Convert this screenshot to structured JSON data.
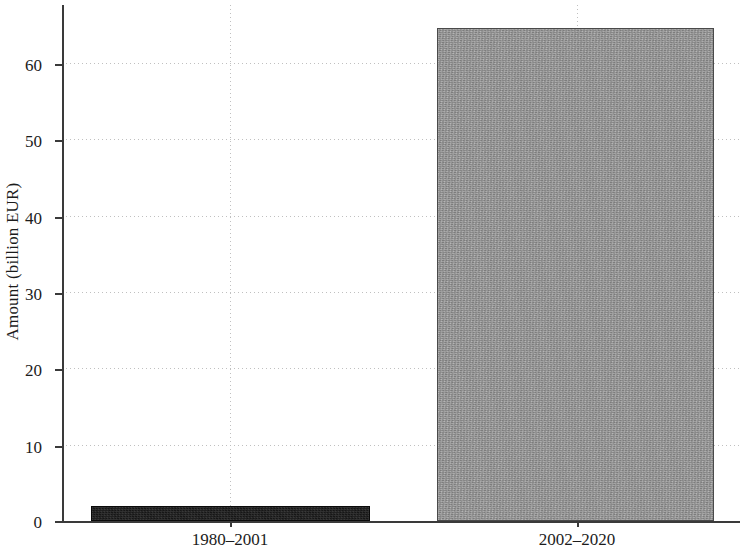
{
  "chart_data": {
    "type": "bar",
    "title": "",
    "subtitle": "",
    "xlabel": "",
    "ylabel": "Amount (billion EUR)",
    "categories": [
      "1980–2001",
      "2002–2020"
    ],
    "values": [
      2.0,
      64.6
    ],
    "series": [
      {
        "name": "Amount",
        "values": [
          2.0,
          64.6
        ],
        "colors": [
          "#161616",
          "#9b9b9b"
        ]
      }
    ],
    "ylim": [
      0,
      67.9
    ],
    "yticks": [
      0,
      10,
      20,
      30,
      40,
      50,
      60
    ],
    "ytick_labels": [
      "0",
      "10",
      "20",
      "30",
      "40",
      "50",
      "60"
    ],
    "grid": "both-dotted",
    "legend": "none",
    "bar_colors": {
      "first_period": "#161616",
      "second_period": "#9b9b9b"
    }
  },
  "axes": {
    "y_title": "Amount (billion EUR)",
    "y_ticks": [
      {
        "label": "60",
        "value": 60
      },
      {
        "label": "50",
        "value": 50
      },
      {
        "label": "40",
        "value": 40
      },
      {
        "label": "30",
        "value": 30
      },
      {
        "label": "20",
        "value": 20
      },
      {
        "label": "10",
        "value": 10
      },
      {
        "label": "0",
        "value": 0
      }
    ],
    "x_ticks": [
      {
        "label": "1980–2001"
      },
      {
        "label": "2002–2020"
      }
    ]
  },
  "bars": [
    {
      "category": "1980–2001",
      "value": 2.0,
      "fill": "#161616"
    },
    {
      "category": "2002–2020",
      "value": 64.6,
      "fill": "#9b9b9b"
    }
  ]
}
